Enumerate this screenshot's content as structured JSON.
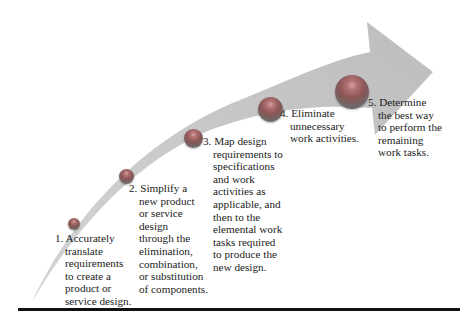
{
  "diagram": {
    "type": "curved-arrow-process",
    "arrow_color": "#c8c8c8",
    "ball_color": "#8a5a5a",
    "steps": [
      {
        "number": "1.",
        "lines": [
          "Accurately",
          "translate",
          "requirements",
          "to create a",
          "product or",
          "service design."
        ]
      },
      {
        "number": "2.",
        "lines": [
          "Simplify a",
          "new product",
          "or service",
          "design",
          "through the",
          "elimination,",
          "combination,",
          "or substitution",
          "of components."
        ]
      },
      {
        "number": "3.",
        "lines": [
          "Map design",
          "requirements to",
          "specifications",
          "and work",
          "activities as",
          "applicable, and",
          "then to the",
          "elemental work",
          "tasks required",
          "to produce the",
          "new design."
        ]
      },
      {
        "number": "4.",
        "lines": [
          "Eliminate",
          "unnecessary",
          "work activities."
        ]
      },
      {
        "number": "5.",
        "lines": [
          "Determine",
          "the best way",
          "to perform the",
          "remaining",
          "work tasks."
        ]
      }
    ]
  }
}
